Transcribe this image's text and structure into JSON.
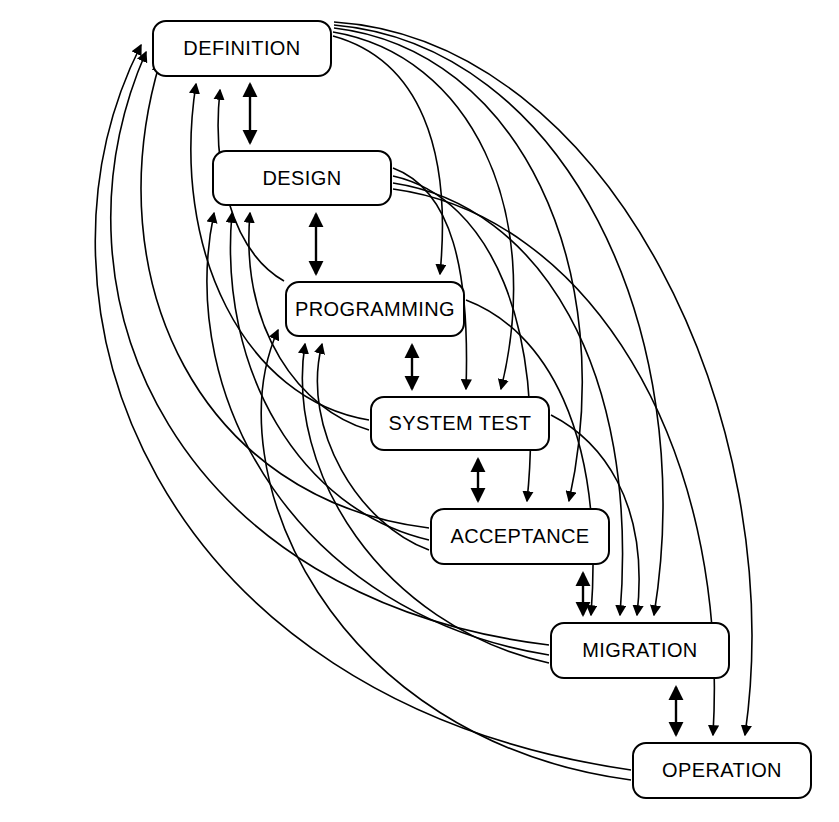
{
  "diagram": {
    "type": "software-lifecycle-phase-diagram",
    "title": "",
    "background_color": "#ffffff",
    "line_color": "#000000",
    "node_fill": "#ffffff",
    "node_border": "#000000",
    "canvas": {
      "width": 839,
      "height": 822
    },
    "nodes": [
      {
        "id": "definition",
        "label": "DEFINITION",
        "x": 152,
        "y": 20,
        "w": 180,
        "h": 57
      },
      {
        "id": "design",
        "label": "DESIGN",
        "x": 212,
        "y": 150,
        "w": 180,
        "h": 56
      },
      {
        "id": "programming",
        "label": "PROGRAMMING",
        "x": 285,
        "y": 281,
        "w": 180,
        "h": 56
      },
      {
        "id": "systemtest",
        "label": "SYSTEM TEST",
        "x": 370,
        "y": 396,
        "w": 180,
        "h": 55
      },
      {
        "id": "acceptance",
        "label": "ACCEPTANCE",
        "x": 430,
        "y": 508,
        "w": 180,
        "h": 57
      },
      {
        "id": "migration",
        "label": "MIGRATION",
        "x": 550,
        "y": 622,
        "w": 180,
        "h": 57
      },
      {
        "id": "operation",
        "label": "OPERATION",
        "x": 632,
        "y": 742,
        "w": 180,
        "h": 57
      }
    ],
    "sequential_links": [
      {
        "from": "definition",
        "to": "design",
        "kind": "bidirectional"
      },
      {
        "from": "design",
        "to": "programming",
        "kind": "bidirectional"
      },
      {
        "from": "programming",
        "to": "systemtest",
        "kind": "bidirectional"
      },
      {
        "from": "systemtest",
        "to": "acceptance",
        "kind": "bidirectional"
      },
      {
        "from": "acceptance",
        "to": "migration",
        "kind": "bidirectional"
      },
      {
        "from": "migration",
        "to": "operation",
        "kind": "bidirectional"
      }
    ],
    "forward_skip_links": [
      {
        "from": "definition",
        "to": "programming"
      },
      {
        "from": "definition",
        "to": "systemtest"
      },
      {
        "from": "definition",
        "to": "acceptance"
      },
      {
        "from": "definition",
        "to": "migration"
      },
      {
        "from": "definition",
        "to": "operation"
      },
      {
        "from": "design",
        "to": "systemtest"
      },
      {
        "from": "design",
        "to": "acceptance"
      },
      {
        "from": "design",
        "to": "migration"
      },
      {
        "from": "design",
        "to": "operation"
      },
      {
        "from": "programming",
        "to": "migration"
      },
      {
        "from": "systemtest",
        "to": "migration"
      }
    ],
    "feedback_links": [
      {
        "from": "programming",
        "to": "definition"
      },
      {
        "from": "systemtest",
        "to": "definition"
      },
      {
        "from": "acceptance",
        "to": "definition"
      },
      {
        "from": "migration",
        "to": "definition"
      },
      {
        "from": "operation",
        "to": "definition"
      },
      {
        "from": "systemtest",
        "to": "design"
      },
      {
        "from": "acceptance",
        "to": "design"
      },
      {
        "from": "migration",
        "to": "design"
      },
      {
        "from": "acceptance",
        "to": "programming"
      },
      {
        "from": "migration",
        "to": "programming"
      },
      {
        "from": "operation",
        "to": "programming"
      }
    ]
  }
}
